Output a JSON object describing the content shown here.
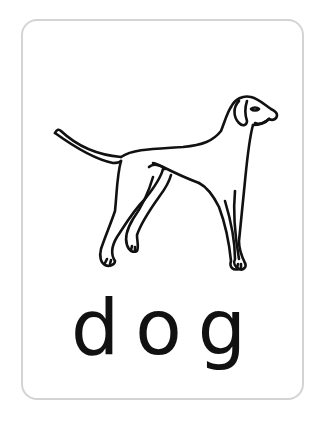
{
  "card": {
    "word": "dog",
    "illustration": "dog-outline-drawing",
    "border_color": "#d4d4d4",
    "text_color": "#111111"
  }
}
